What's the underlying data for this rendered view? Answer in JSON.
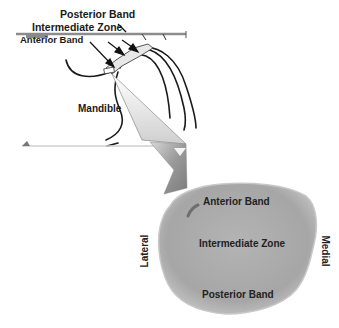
{
  "upper_view": {
    "labels": {
      "posterior_band": "Posterior Band",
      "intermediate_zone": "Intermediate Zone",
      "anterior_band": "Anterior Band",
      "mandible": "Mandible"
    }
  },
  "disc_view": {
    "labels": {
      "anterior_band": "Anterior Band",
      "intermediate_zone": "Intermediate Zone",
      "posterior_band": "Posterior Band",
      "lateral": "Lateral",
      "medial": "Medial"
    },
    "colors": {
      "disc_fill": "#a9a9a9",
      "disc_edge": "#bdbdbd",
      "callout_dark": "#8a8a8a",
      "callout_light": "#d0d0d0"
    }
  },
  "colors": {
    "line": "#1a1a1a",
    "plane": "#9a9a9a"
  }
}
